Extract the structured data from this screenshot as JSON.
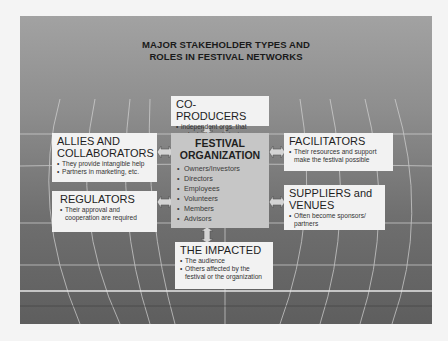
{
  "title": {
    "line1": "MAJOR STAKEHOLDER TYPES AND",
    "line2": "ROLES IN FESTIVAL NETWORKS"
  },
  "center": {
    "heading_line1": "FESTIVAL",
    "heading_line2": "ORGANIZATION",
    "items": [
      "Owners/Investors",
      "Directors",
      "Employees",
      "Volunteers",
      "Members",
      "Advisors"
    ]
  },
  "stakeholders": {
    "coproducers": {
      "heading": "CO-PRODUCERS",
      "items": [
        "independent orgs. that voluntarily participate"
      ]
    },
    "allies": {
      "heading_line1": "ALLIES AND",
      "heading_line2": "COLLABORATORS",
      "items": [
        "They provide intangible help",
        "Partners in marketing, etc."
      ]
    },
    "regulators": {
      "heading": "REGULATORS",
      "items": [
        "Their approval and cooperation are required"
      ]
    },
    "facilitators": {
      "heading": "FACILITATORS",
      "items": [
        "Their resources and support make the festival possible"
      ]
    },
    "suppliers": {
      "heading_line1": "SUPPLIERS and",
      "heading_line2": "VENUES",
      "items": [
        "Often become sponsors/ partners"
      ]
    },
    "impacted": {
      "heading": "THE IMPACTED",
      "items": [
        "The audience",
        "Others affected by the festival or the organization"
      ]
    }
  },
  "colors": {
    "panel_top": "#a2a2a2",
    "panel_bottom": "#5e5e5e",
    "box_fill": "#f2f2f2",
    "center_fill": "#c6c6c6",
    "arrow_fill": "#d4d4d4"
  }
}
